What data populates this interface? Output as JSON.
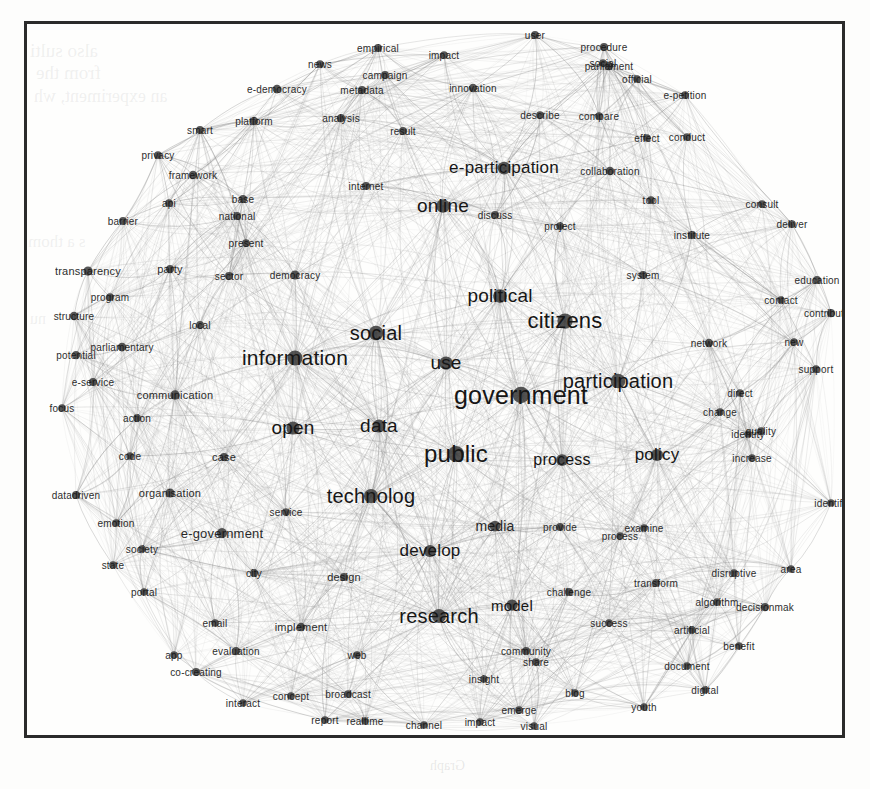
{
  "figure": {
    "type": "network-graph",
    "background_color": "#fdfdfc",
    "frame_color": "#2b2b2b",
    "node_color": "#3a3a3a",
    "edge_color": "#8a8a8a",
    "label_color": "#161616"
  },
  "bleed_through_text": [
    {
      "text": "also sulti",
      "x": 30,
      "y": 40,
      "size": 19
    },
    {
      "text": "from the",
      "x": 36,
      "y": 62,
      "size": 19
    },
    {
      "text": "an experiment, wh",
      "x": 34,
      "y": 86,
      "size": 18
    },
    {
      "text": "s a  thom",
      "x": 28,
      "y": 232,
      "size": 17
    },
    {
      "text": "nu",
      "x": 30,
      "y": 310,
      "size": 16
    },
    {
      "text": "Graph",
      "x": 430,
      "y": 758,
      "size": 14
    }
  ],
  "chart_data": {
    "type": "network",
    "title": "",
    "node_count": 120,
    "nodes": [
      {
        "label": "government",
        "x": 518,
        "y": 392,
        "size": 25,
        "weight": 100
      },
      {
        "label": "public",
        "x": 453,
        "y": 451,
        "size": 24,
        "weight": 96
      },
      {
        "label": "citizens",
        "x": 562,
        "y": 318,
        "size": 22,
        "weight": 90
      },
      {
        "label": "information",
        "x": 292,
        "y": 355,
        "size": 21,
        "weight": 88
      },
      {
        "label": "participation",
        "x": 615,
        "y": 378,
        "size": 20,
        "weight": 85
      },
      {
        "label": "social",
        "x": 373,
        "y": 330,
        "size": 20,
        "weight": 84
      },
      {
        "label": "technolog",
        "x": 368,
        "y": 493,
        "size": 20,
        "weight": 82
      },
      {
        "label": "research",
        "x": 436,
        "y": 613,
        "size": 20,
        "weight": 80
      },
      {
        "label": "political",
        "x": 497,
        "y": 293,
        "size": 19,
        "weight": 78
      },
      {
        "label": "online",
        "x": 440,
        "y": 203,
        "size": 19,
        "weight": 76
      },
      {
        "label": "e-participation",
        "x": 501,
        "y": 165,
        "size": 17,
        "weight": 70
      },
      {
        "label": "use",
        "x": 443,
        "y": 360,
        "size": 19,
        "weight": 74
      },
      {
        "label": "open",
        "x": 290,
        "y": 425,
        "size": 19,
        "weight": 73
      },
      {
        "label": "data",
        "x": 376,
        "y": 423,
        "size": 19,
        "weight": 72
      },
      {
        "label": "develop",
        "x": 427,
        "y": 548,
        "size": 17,
        "weight": 66
      },
      {
        "label": "policy",
        "x": 654,
        "y": 452,
        "size": 17,
        "weight": 65
      },
      {
        "label": "process",
        "x": 559,
        "y": 457,
        "size": 16,
        "weight": 62
      },
      {
        "label": "model",
        "x": 509,
        "y": 602,
        "size": 15,
        "weight": 58
      },
      {
        "label": "media",
        "x": 492,
        "y": 523,
        "size": 14,
        "weight": 54
      },
      {
        "label": "e-government",
        "x": 219,
        "y": 530,
        "size": 13,
        "weight": 50
      },
      {
        "label": "communication",
        "x": 172,
        "y": 392,
        "size": 11,
        "weight": 44
      },
      {
        "label": "transparency",
        "x": 85,
        "y": 268,
        "size": 11,
        "weight": 42
      },
      {
        "label": "organisation",
        "x": 167,
        "y": 490,
        "size": 11,
        "weight": 41
      },
      {
        "label": "parliamentary",
        "x": 119,
        "y": 344,
        "size": 10,
        "weight": 38
      },
      {
        "label": "e-democracy",
        "x": 274,
        "y": 86,
        "size": 10,
        "weight": 38
      },
      {
        "label": "collaboration",
        "x": 607,
        "y": 168,
        "size": 10,
        "weight": 37
      },
      {
        "label": "contribution",
        "x": 828,
        "y": 310,
        "size": 10,
        "weight": 34
      },
      {
        "label": "decisionmak",
        "x": 762,
        "y": 604,
        "size": 10,
        "weight": 34
      },
      {
        "label": "co-creating",
        "x": 193,
        "y": 669,
        "size": 10,
        "weight": 33
      },
      {
        "label": "implement",
        "x": 298,
        "y": 624,
        "size": 11,
        "weight": 36
      },
      {
        "label": "framework",
        "x": 190,
        "y": 172,
        "size": 10,
        "weight": 36
      },
      {
        "label": "structure",
        "x": 71,
        "y": 313,
        "size": 10,
        "weight": 35
      },
      {
        "label": "potential",
        "x": 73,
        "y": 352,
        "size": 10,
        "weight": 34
      },
      {
        "label": "democracy",
        "x": 292,
        "y": 272,
        "size": 10,
        "weight": 40
      },
      {
        "label": "e-service",
        "x": 90,
        "y": 379,
        "size": 10,
        "weight": 32
      },
      {
        "label": "datadriven",
        "x": 73,
        "y": 492,
        "size": 10,
        "weight": 32
      },
      {
        "label": "evaluation",
        "x": 233,
        "y": 648,
        "size": 10,
        "weight": 31
      },
      {
        "label": "parliament",
        "x": 606,
        "y": 63,
        "size": 10,
        "weight": 35
      },
      {
        "label": "procedure",
        "x": 601,
        "y": 44,
        "size": 10,
        "weight": 32
      },
      {
        "label": "innovation",
        "x": 470,
        "y": 85,
        "size": 10,
        "weight": 35
      },
      {
        "label": "education",
        "x": 814,
        "y": 277,
        "size": 10,
        "weight": 33
      },
      {
        "label": "community",
        "x": 523,
        "y": 648,
        "size": 10,
        "weight": 31
      },
      {
        "label": "disruptive",
        "x": 731,
        "y": 570,
        "size": 10,
        "weight": 30
      },
      {
        "label": "algorithm",
        "x": 714,
        "y": 599,
        "size": 10,
        "weight": 30
      },
      {
        "label": "artificial",
        "x": 689,
        "y": 627,
        "size": 10,
        "weight": 29
      },
      {
        "label": "document",
        "x": 684,
        "y": 663,
        "size": 10,
        "weight": 29
      },
      {
        "label": "challenge",
        "x": 566,
        "y": 589,
        "size": 10,
        "weight": 32
      },
      {
        "label": "transform",
        "x": 653,
        "y": 580,
        "size": 10,
        "weight": 32
      },
      {
        "label": "broadcast",
        "x": 345,
        "y": 691,
        "size": 10,
        "weight": 28
      },
      {
        "label": "metadata",
        "x": 359,
        "y": 87,
        "size": 10,
        "weight": 31
      },
      {
        "label": "empirical",
        "x": 375,
        "y": 45,
        "size": 10,
        "weight": 31
      },
      {
        "label": "campaign",
        "x": 382,
        "y": 72,
        "size": 10,
        "weight": 31
      },
      {
        "label": "platform",
        "x": 251,
        "y": 118,
        "size": 10,
        "weight": 36
      },
      {
        "label": "analysis",
        "x": 338,
        "y": 115,
        "size": 10,
        "weight": 34
      },
      {
        "label": "institute",
        "x": 689,
        "y": 232,
        "size": 10,
        "weight": 31
      },
      {
        "label": "describe",
        "x": 537,
        "y": 112,
        "size": 10,
        "weight": 30
      },
      {
        "label": "compare",
        "x": 596,
        "y": 113,
        "size": 10,
        "weight": 30
      },
      {
        "label": "e-petition",
        "x": 682,
        "y": 92,
        "size": 10,
        "weight": 30
      },
      {
        "label": "official",
        "x": 634,
        "y": 76,
        "size": 10,
        "weight": 29
      },
      {
        "label": "conduct",
        "x": 684,
        "y": 134,
        "size": 10,
        "weight": 29
      },
      {
        "label": "consult",
        "x": 759,
        "y": 201,
        "size": 10,
        "weight": 30
      },
      {
        "label": "deliver",
        "x": 789,
        "y": 221,
        "size": 10,
        "weight": 30
      },
      {
        "label": "contact",
        "x": 778,
        "y": 297,
        "size": 10,
        "weight": 29
      },
      {
        "label": "network",
        "x": 706,
        "y": 340,
        "size": 10,
        "weight": 35
      },
      {
        "label": "support",
        "x": 813,
        "y": 366,
        "size": 10,
        "weight": 30
      },
      {
        "label": "increase",
        "x": 749,
        "y": 455,
        "size": 10,
        "weight": 29
      },
      {
        "label": "quality",
        "x": 758,
        "y": 428,
        "size": 10,
        "weight": 28
      },
      {
        "label": "identify",
        "x": 828,
        "y": 500,
        "size": 10,
        "weight": 28
      },
      {
        "label": "change",
        "x": 717,
        "y": 409,
        "size": 10,
        "weight": 29
      },
      {
        "label": "direct",
        "x": 737,
        "y": 390,
        "size": 10,
        "weight": 28
      },
      {
        "label": "provide",
        "x": 557,
        "y": 524,
        "size": 10,
        "weight": 31
      },
      {
        "label": "process2",
        "x": 617,
        "y": 533,
        "size": 10,
        "weight": 27
      },
      {
        "label": "examine",
        "x": 641,
        "y": 525,
        "size": 10,
        "weight": 28
      },
      {
        "label": "success",
        "x": 606,
        "y": 620,
        "size": 10,
        "weight": 28
      },
      {
        "label": "benefit",
        "x": 736,
        "y": 643,
        "size": 10,
        "weight": 27
      },
      {
        "label": "digital",
        "x": 702,
        "y": 687,
        "size": 10,
        "weight": 27
      },
      {
        "label": "youth",
        "x": 641,
        "y": 704,
        "size": 10,
        "weight": 27
      },
      {
        "label": "emerge",
        "x": 516,
        "y": 707,
        "size": 10,
        "weight": 30
      },
      {
        "label": "blog",
        "x": 572,
        "y": 690,
        "size": 10,
        "weight": 27
      },
      {
        "label": "share",
        "x": 533,
        "y": 659,
        "size": 10,
        "weight": 29
      },
      {
        "label": "insight",
        "x": 481,
        "y": 676,
        "size": 10,
        "weight": 27
      },
      {
        "label": "interact",
        "x": 240,
        "y": 700,
        "size": 10,
        "weight": 28
      },
      {
        "label": "concept",
        "x": 288,
        "y": 693,
        "size": 10,
        "weight": 28
      },
      {
        "label": "report",
        "x": 322,
        "y": 717,
        "size": 10,
        "weight": 28
      },
      {
        "label": "realtime",
        "x": 362,
        "y": 718,
        "size": 10,
        "weight": 27
      },
      {
        "label": "channel",
        "x": 421,
        "y": 722,
        "size": 10,
        "weight": 27
      },
      {
        "label": "impact",
        "x": 477,
        "y": 719,
        "size": 10,
        "weight": 27
      },
      {
        "label": "visual",
        "x": 531,
        "y": 723,
        "size": 10,
        "weight": 27
      },
      {
        "label": "web",
        "x": 354,
        "y": 652,
        "size": 10,
        "weight": 28
      },
      {
        "label": "email",
        "x": 212,
        "y": 620,
        "size": 10,
        "weight": 28
      },
      {
        "label": "app",
        "x": 171,
        "y": 652,
        "size": 10,
        "weight": 28
      },
      {
        "label": "portal",
        "x": 141,
        "y": 589,
        "size": 10,
        "weight": 28
      },
      {
        "label": "state",
        "x": 110,
        "y": 562,
        "size": 10,
        "weight": 29
      },
      {
        "label": "society",
        "x": 139,
        "y": 546,
        "size": 10,
        "weight": 29
      },
      {
        "label": "emotion",
        "x": 113,
        "y": 520,
        "size": 10,
        "weight": 28
      },
      {
        "label": "code",
        "x": 127,
        "y": 453,
        "size": 10,
        "weight": 28
      },
      {
        "label": "case",
        "x": 221,
        "y": 454,
        "size": 11,
        "weight": 32
      },
      {
        "label": "action",
        "x": 134,
        "y": 415,
        "size": 10,
        "weight": 30
      },
      {
        "label": "focus",
        "x": 59,
        "y": 405,
        "size": 10,
        "weight": 28
      },
      {
        "label": "program",
        "x": 107,
        "y": 294,
        "size": 10,
        "weight": 30
      },
      {
        "label": "party",
        "x": 167,
        "y": 266,
        "size": 11,
        "weight": 34
      },
      {
        "label": "sector",
        "x": 226,
        "y": 273,
        "size": 10,
        "weight": 31
      },
      {
        "label": "local",
        "x": 197,
        "y": 322,
        "size": 10,
        "weight": 31
      },
      {
        "label": "barrier",
        "x": 120,
        "y": 218,
        "size": 10,
        "weight": 31
      },
      {
        "label": "api",
        "x": 166,
        "y": 200,
        "size": 10,
        "weight": 29
      },
      {
        "label": "base",
        "x": 240,
        "y": 196,
        "size": 10,
        "weight": 31
      },
      {
        "label": "smart",
        "x": 197,
        "y": 127,
        "size": 10,
        "weight": 31
      },
      {
        "label": "privacy",
        "x": 155,
        "y": 152,
        "size": 10,
        "weight": 30
      },
      {
        "label": "national",
        "x": 234,
        "y": 213,
        "size": 10,
        "weight": 31
      },
      {
        "label": "present",
        "x": 243,
        "y": 240,
        "size": 10,
        "weight": 30
      },
      {
        "label": "internet",
        "x": 363,
        "y": 183,
        "size": 10,
        "weight": 33
      },
      {
        "label": "result",
        "x": 400,
        "y": 128,
        "size": 10,
        "weight": 31
      },
      {
        "label": "news",
        "x": 317,
        "y": 61,
        "size": 10,
        "weight": 30
      },
      {
        "label": "impact2",
        "x": 441,
        "y": 52,
        "size": 10,
        "weight": 30
      },
      {
        "label": "user",
        "x": 532,
        "y": 32,
        "size": 10,
        "weight": 31
      },
      {
        "label": "social2",
        "x": 600,
        "y": 60,
        "size": 10,
        "weight": 28
      },
      {
        "label": "discuss",
        "x": 492,
        "y": 212,
        "size": 10,
        "weight": 32
      },
      {
        "label": "project",
        "x": 557,
        "y": 223,
        "size": 10,
        "weight": 30
      },
      {
        "label": "tool",
        "x": 648,
        "y": 197,
        "size": 10,
        "weight": 30
      },
      {
        "label": "system",
        "x": 640,
        "y": 272,
        "size": 10,
        "weight": 32
      },
      {
        "label": "new",
        "x": 791,
        "y": 339,
        "size": 10,
        "weight": 28
      },
      {
        "label": "effect",
        "x": 644,
        "y": 135,
        "size": 10,
        "weight": 28
      },
      {
        "label": "area",
        "x": 788,
        "y": 566,
        "size": 10,
        "weight": 28
      },
      {
        "label": "service",
        "x": 283,
        "y": 509,
        "size": 10,
        "weight": 30
      },
      {
        "label": "city",
        "x": 251,
        "y": 570,
        "size": 10,
        "weight": 31
      },
      {
        "label": "design",
        "x": 341,
        "y": 574,
        "size": 11,
        "weight": 32
      },
      {
        "label": "identity",
        "x": 745,
        "y": 431,
        "size": 10,
        "weight": 26
      }
    ],
    "edges_style": "curved bundled arcs, dense hairball",
    "layout": "force-directed circular"
  }
}
